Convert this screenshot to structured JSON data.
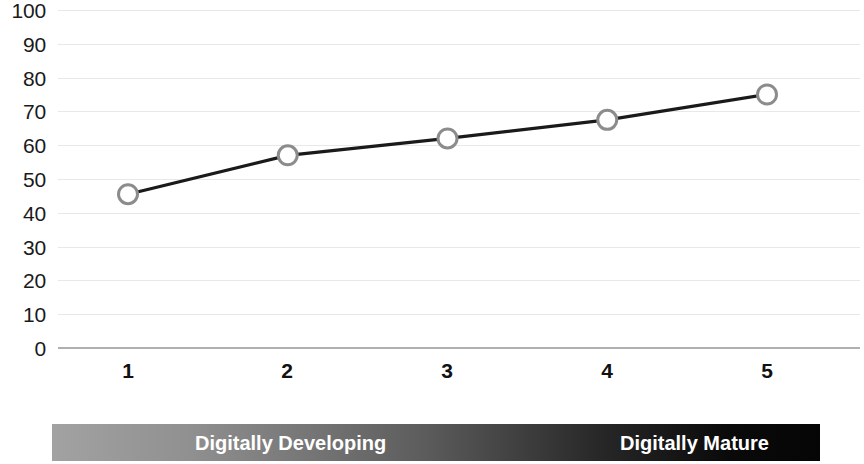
{
  "chart_data": {
    "type": "line",
    "title": "",
    "subtitle": "",
    "xlabel": "",
    "ylabel": "",
    "x": [
      1,
      2,
      3,
      4,
      5
    ],
    "categories": [
      "1",
      "2",
      "3",
      "4",
      "5"
    ],
    "values": [
      45.5,
      57,
      62,
      67.5,
      75
    ],
    "series": [
      {
        "name": "",
        "values": [
          45.5,
          57,
          62,
          67.5,
          75
        ]
      }
    ],
    "ylim": [
      0,
      100
    ],
    "xlim": [
      1,
      5
    ],
    "y_ticks": [
      0,
      10,
      20,
      30,
      40,
      50,
      60,
      70,
      80,
      90,
      100
    ],
    "y_tick_labels": [
      "0",
      "10",
      "20",
      "30",
      "40",
      "50",
      "60",
      "70",
      "80",
      "90",
      "100"
    ],
    "x_tick_labels": [
      "1",
      "2",
      "3",
      "4",
      "5"
    ],
    "grid": true,
    "legend": "none",
    "line_color": "#1a1a1a",
    "marker_color": "#8c8c8c",
    "marker_fill": "#ffffff",
    "gridline_color": "#e8e8e8",
    "annotations": [
      {
        "id": "maturity-scale",
        "labels": [
          "Digitally Developing",
          "Digitally Mature"
        ],
        "gradient_from": "#a2a2a2",
        "gradient_to": "#050505",
        "text_color": "#ffffff"
      }
    ]
  },
  "axis": {
    "y_labels": [
      "100",
      "90",
      "80",
      "70",
      "60",
      "50",
      "40",
      "30",
      "20",
      "10",
      "0"
    ],
    "x_labels": [
      "1",
      "2",
      "3",
      "4",
      "5"
    ]
  },
  "maturity_bar": {
    "developing_label": "Digitally Developing",
    "mature_label": "Digitally Mature"
  }
}
